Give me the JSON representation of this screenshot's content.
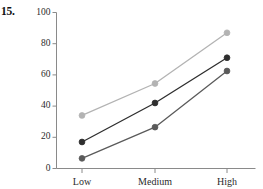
{
  "problem": {
    "number": "15."
  },
  "chart_data": {
    "type": "line",
    "title": "",
    "subtitle": "",
    "xlabel": "",
    "ylabel": "",
    "categories": [
      "Low",
      "Medium",
      "High"
    ],
    "ylim": [
      0,
      100
    ],
    "yticks": [
      0,
      20,
      40,
      60,
      80,
      100
    ],
    "ytick_labels": [
      "0",
      "20",
      "40",
      "60",
      "80",
      "100"
    ],
    "xtick_labels": [
      "Low",
      "Medium",
      "High"
    ],
    "grid": false,
    "legend": "none",
    "markers": "filled-circle",
    "series": [
      {
        "name": "upper",
        "color": "#b3b3b3",
        "values": [
          34,
          54.5,
          87
        ]
      },
      {
        "name": "middle",
        "color": "#2e2e2e",
        "values": [
          17,
          42,
          71
        ]
      },
      {
        "name": "lower",
        "color": "#5a5a5a",
        "values": [
          6.5,
          26.5,
          62.5
        ]
      }
    ],
    "axis_color": "#8a8a8a"
  }
}
